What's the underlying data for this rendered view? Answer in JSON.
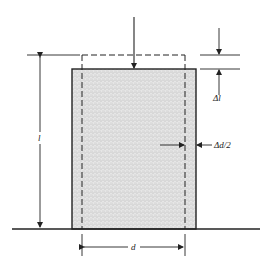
{
  "diagram": {
    "type": "compression-of-cylinder",
    "labels": {
      "length": "l",
      "delta_length": "Δl",
      "delta_diameter_half": "Δd/2",
      "diameter": "d"
    },
    "colors": {
      "ink": "#222222",
      "fill": "#d9d9d9",
      "background": "#ffffff"
    }
  }
}
